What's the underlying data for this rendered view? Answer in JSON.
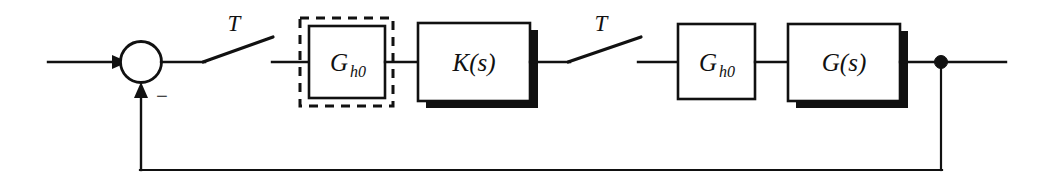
{
  "diagram": {
    "type": "control-system-block-diagram",
    "colors": {
      "line": "#111111",
      "fill": "#ffffff",
      "shadow": "#111111",
      "background": "#ffffff"
    },
    "blocks": [
      {
        "id": "gh0-left",
        "label": "G",
        "subscript": "h0",
        "style": "dashed-enclosure",
        "shadow": false
      },
      {
        "id": "k-s",
        "label": "K(s)",
        "style": "solid",
        "shadow": true
      },
      {
        "id": "gh0-right",
        "label": "G",
        "subscript": "h0",
        "style": "solid",
        "shadow": false
      },
      {
        "id": "g-s",
        "label": "G(s)",
        "style": "solid",
        "shadow": true
      }
    ],
    "switches": [
      {
        "id": "sampler-1",
        "label": "T"
      },
      {
        "id": "sampler-2",
        "label": "T"
      }
    ],
    "summing_junction": {
      "id": "sum-1",
      "input_sign": "",
      "feedback_sign": "−"
    },
    "nodes": [
      {
        "id": "takeoff-1",
        "kind": "takeoff-dot"
      }
    ],
    "signals": {
      "input": "",
      "output": "",
      "feedback": ""
    }
  }
}
